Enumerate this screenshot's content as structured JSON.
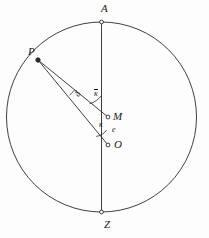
{
  "figure": {
    "background_color": "#fdfdfd",
    "stroke_color": "#2a2a2a",
    "label_color": "#1a1a1a"
  },
  "labels": {
    "A": "A",
    "P": "P",
    "M": "M",
    "O": "O",
    "Z": "Z",
    "e": "e",
    "kappa": "κ",
    "kappa_bar": "κ",
    "delta": "δ"
  },
  "geometry": {
    "circle": {
      "cx": 101.5,
      "cy": 117,
      "r": 95
    },
    "points": [
      {
        "name": "A",
        "x": 101.5,
        "y": 22,
        "marker": "open-dot"
      },
      {
        "name": "P",
        "x": 38,
        "y": 60,
        "marker": "filled-dot"
      },
      {
        "name": "M",
        "x": 108,
        "y": 117,
        "marker": "open-dot"
      },
      {
        "name": "O",
        "x": 108,
        "y": 145,
        "marker": "open-dot"
      },
      {
        "name": "Z",
        "x": 101.5,
        "y": 212,
        "marker": "open-dot"
      }
    ],
    "segments": [
      {
        "name": "axis-A-Z",
        "from": "A",
        "to": "Z"
      },
      {
        "name": "chord-P-M",
        "from": "P",
        "to": "M"
      },
      {
        "name": "chord-P-O",
        "from": "P",
        "to": "O"
      }
    ],
    "arcs": [
      {
        "name": "angle-kappa-bar-at-M",
        "label": "kappa_bar",
        "vertex": "M",
        "radius": 22
      },
      {
        "name": "angle-kappa-at-O",
        "label": "kappa",
        "vertex": "O",
        "radius": 15
      },
      {
        "name": "angle-delta-at-P",
        "label": "delta",
        "vertex": "P",
        "radius": 48
      }
    ]
  }
}
